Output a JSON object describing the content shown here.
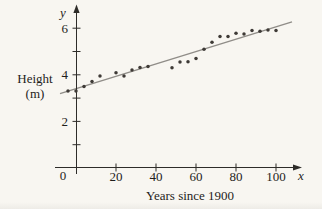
{
  "figure": {
    "y_axis_title_line1": "Height",
    "y_axis_title_line2": "(m)",
    "x_axis_title": "Years since 1900",
    "x_axis_symbol": "x",
    "y_axis_symbol": "y",
    "origin_label": "0"
  },
  "chart_data": {
    "type": "scatter",
    "title": "",
    "xlabel": "Years since 1900",
    "ylabel": "Height (m)",
    "xlim": [
      -9,
      112
    ],
    "ylim": [
      0,
      6.9
    ],
    "grid": false,
    "legend": "none",
    "x_ticks": [
      20,
      40,
      60,
      80,
      100
    ],
    "x_origin_tick": 0,
    "y_major_ticks": [
      2,
      4,
      6
    ],
    "y_minor_ticks": [
      1,
      3,
      5
    ],
    "points": [
      [
        -4,
        3.3
      ],
      [
        0,
        3.3
      ],
      [
        4,
        3.5
      ],
      [
        8,
        3.71
      ],
      [
        12,
        3.95
      ],
      [
        20,
        4.09
      ],
      [
        24,
        3.95
      ],
      [
        28,
        4.2
      ],
      [
        32,
        4.31
      ],
      [
        36,
        4.35
      ],
      [
        48,
        4.3
      ],
      [
        52,
        4.55
      ],
      [
        56,
        4.56
      ],
      [
        60,
        4.7
      ],
      [
        64,
        5.1
      ],
      [
        68,
        5.4
      ],
      [
        72,
        5.64
      ],
      [
        76,
        5.64
      ],
      [
        80,
        5.78
      ],
      [
        84,
        5.75
      ],
      [
        88,
        5.9
      ],
      [
        92,
        5.87
      ],
      [
        96,
        5.92
      ],
      [
        100,
        5.9
      ]
    ],
    "trend_line": {
      "slope": 0.0266,
      "intercept": 3.4,
      "x_start": -8,
      "x_end": 108
    },
    "colors": {
      "point": "#3e3a36",
      "trend": "#908d88",
      "axis": "#2e2c29",
      "text": "#1f1d1b",
      "background": "#f8f6f1"
    }
  }
}
